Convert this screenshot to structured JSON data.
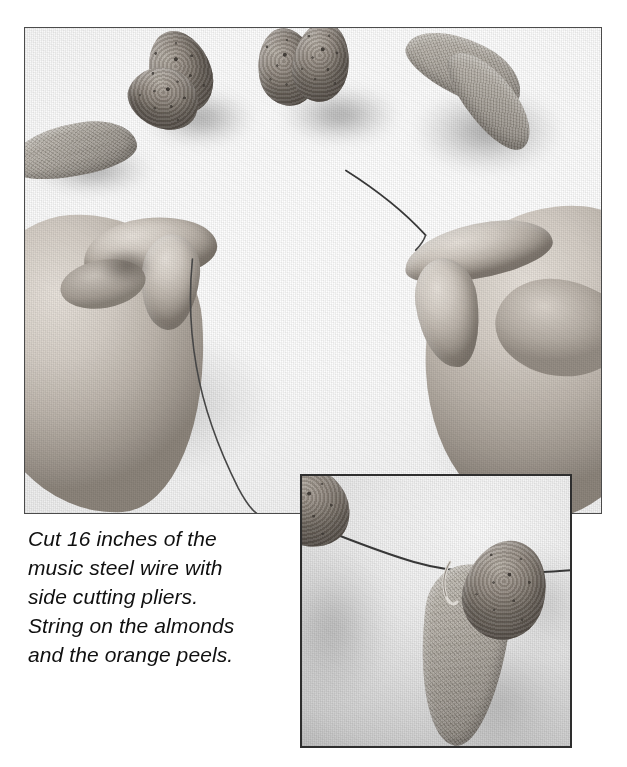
{
  "page": {
    "background_color": "#ffffff",
    "width": 627,
    "height": 767
  },
  "main_photo": {
    "alt": "Two hands holding a length of music steel wire over a white surface, with almonds and dried orange peels scattered above",
    "border_color": "#4b4b4b",
    "objects": [
      {
        "name": "almond",
        "count": 4,
        "location": "top center and top right"
      },
      {
        "name": "orange-peel",
        "count": 3,
        "location": "left edge and top right"
      },
      {
        "name": "left-hand",
        "count": 1,
        "location": "center left, pinching the wire"
      },
      {
        "name": "right-hand",
        "count": 1,
        "location": "center right, holding the wire tip"
      },
      {
        "name": "steel-wire",
        "count": 1,
        "location": "curving from right hand down across the frame"
      }
    ]
  },
  "inset_photo": {
    "alt": "Close-up of almonds and an orange peel strung onto the steel wire",
    "border_color": "#2e2e2e",
    "objects": [
      {
        "name": "almond",
        "count": 2,
        "location": "upper left and center right"
      },
      {
        "name": "orange-peel",
        "count": 1,
        "location": "center, hanging from the wire"
      },
      {
        "name": "steel-wire",
        "count": 1,
        "location": "running left to right across the frame"
      }
    ]
  },
  "caption": {
    "lines": [
      "Cut 16 inches of the",
      "music steel wire with",
      "side cutting pliers.",
      "String on the almonds",
      "and the orange peels."
    ],
    "text": "Cut 16 inches of the music steel wire with side cutting pliers. String on the almonds and the orange peels.",
    "measurement": "16 inches",
    "material": "music steel wire",
    "tool": "side cutting pliers",
    "color": "#101010"
  }
}
